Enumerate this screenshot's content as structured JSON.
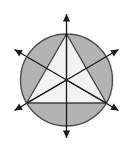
{
  "figure": {
    "title": "Equilateral triangle inscribed in circle with symmetry axes",
    "type": "geometry-diagram",
    "canvas": {
      "width": 133,
      "height": 152,
      "background": "#ffffff"
    },
    "colors": {
      "circle_fill": "#b3b3b3",
      "circle_stroke": "#4d4d4d",
      "triangle_fill": "#f2f2f2",
      "triangle_stroke": "#404040",
      "axis_stroke": "#1a1a1a",
      "arrow_fill": "#1a1a1a",
      "median_stroke": "#333333"
    },
    "circle": {
      "label": "circumscribed-circle",
      "center_x": 66.5,
      "center_y": 80,
      "radius": 46,
      "stroke_width": 1.4
    },
    "triangle": {
      "label": "inscribed-equilateral-triangle",
      "stroke_width": 1.3,
      "vertices": [
        {
          "name": "apex",
          "x": 66.5,
          "y": 34
        },
        {
          "name": "bottom-left",
          "x": 26.7,
          "y": 103
        },
        {
          "name": "bottom-right",
          "x": 106.3,
          "y": 103
        }
      ]
    },
    "center_point": {
      "label": "centroid",
      "x": 66.5,
      "y": 80
    },
    "axes": [
      {
        "name": "vertical-symmetry-axis",
        "angle_deg": 90,
        "x1": 66.5,
        "y1": 138,
        "x2": 66.5,
        "y2": 14,
        "arrowheads": "both"
      },
      {
        "name": "diagonal-axis-ne-sw",
        "angle_deg": 30,
        "x1": 14.5,
        "y1": 110.5,
        "x2": 118.5,
        "y2": 49.5,
        "arrowheads": "both"
      },
      {
        "name": "diagonal-axis-nw-se",
        "angle_deg": 150,
        "x1": 14.5,
        "y1": 49.5,
        "x2": 118.5,
        "y2": 110.5,
        "arrowheads": "both"
      }
    ],
    "medians": [
      {
        "name": "centroid-to-apex",
        "x1": 66.5,
        "y1": 80,
        "x2": 66.5,
        "y2": 34
      },
      {
        "name": "centroid-to-bottom-left",
        "x1": 66.5,
        "y1": 80,
        "x2": 26.7,
        "y2": 103
      },
      {
        "name": "centroid-to-bottom-right",
        "x1": 66.5,
        "y1": 80,
        "x2": 106.3,
        "y2": 103
      }
    ],
    "arrow_size": {
      "length": 7.5,
      "half_width": 3.6
    }
  }
}
